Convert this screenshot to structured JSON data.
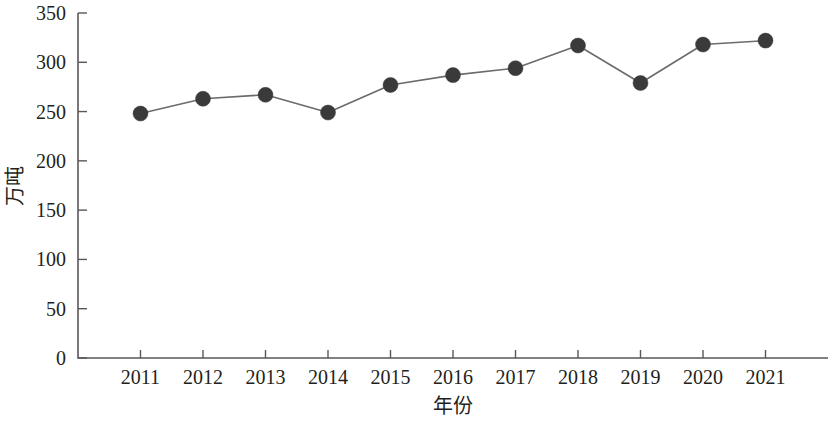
{
  "chart_data": {
    "type": "line",
    "title": "",
    "subtitle": "",
    "xlabel": "年份",
    "ylabel": "万吨",
    "categories": [
      "2011",
      "2012",
      "2013",
      "2014",
      "2015",
      "2016",
      "2017",
      "2018",
      "2019",
      "2020",
      "2021"
    ],
    "x": [
      2011,
      2012,
      2013,
      2014,
      2015,
      2016,
      2017,
      2018,
      2019,
      2020,
      2021
    ],
    "values": [
      248,
      263,
      267,
      249,
      277,
      287,
      294,
      317,
      279,
      318,
      322
    ],
    "series": [
      {
        "name": "产量",
        "values": [
          248,
          263,
          267,
          249,
          277,
          287,
          294,
          317,
          279,
          318,
          322
        ]
      }
    ],
    "ylim": [
      0,
      350
    ],
    "y_ticks": [
      0,
      50,
      100,
      150,
      200,
      250,
      300,
      350
    ],
    "y_tick_labels": [
      "0",
      "50",
      "100",
      "150",
      "200",
      "250",
      "300",
      "350"
    ],
    "x_tick_labels": [
      "2011",
      "2012",
      "2013",
      "2014",
      "2015",
      "2016",
      "2017",
      "2018",
      "2019",
      "2020",
      "2021"
    ],
    "grid": false,
    "legend": false,
    "legend_position": "none",
    "marker": "filled-circle",
    "marker_color": "#3a3a3a",
    "line_color": "#6b6b6b",
    "axis_color": "#58585a",
    "background_color": "#ffffff",
    "annotations": []
  },
  "axes": {
    "y_axis_title": "万吨",
    "x_axis_title": "年份"
  }
}
